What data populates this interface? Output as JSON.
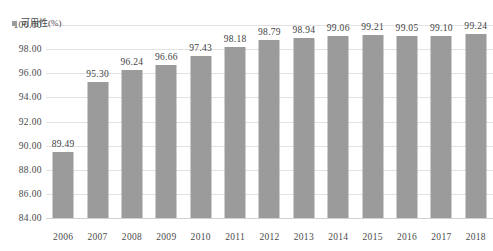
{
  "chart_data": {
    "type": "bar",
    "title": "",
    "subtitle": "",
    "xlabel": "",
    "ylabel": "",
    "categories": [
      "2006",
      "2007",
      "2008",
      "2009",
      "2010",
      "2011",
      "2012",
      "2013",
      "2014",
      "2015",
      "2016",
      "2017",
      "2018"
    ],
    "values": [
      89.49,
      95.3,
      96.24,
      96.66,
      97.43,
      98.18,
      98.79,
      98.94,
      99.06,
      99.21,
      99.05,
      99.1,
      99.24
    ],
    "value_labels": [
      "89.49",
      "95.30",
      "96.24",
      "96.66",
      "97.43",
      "98.18",
      "98.79",
      "98.94",
      "99.06",
      "99.21",
      "99.05",
      "99.10",
      "99.24"
    ],
    "series": [
      {
        "name": "可用性(%)",
        "values": [
          89.49,
          95.3,
          96.24,
          96.66,
          97.43,
          98.18,
          98.79,
          98.94,
          99.06,
          99.21,
          99.05,
          99.1,
          99.24
        ],
        "color": "#9b9b9b"
      }
    ],
    "legend": {
      "position": "top-left",
      "entries": [
        {
          "label": "可用性(%)",
          "color": "#9b9b9b",
          "marker": "square"
        }
      ]
    },
    "ylim": [
      84.0,
      100.0
    ],
    "ytick_step": 2.0,
    "ytick_labels": [
      "100.00",
      "98.00",
      "96.00",
      "94.00",
      "92.00",
      "90.00",
      "88.00",
      "86.00",
      "84.00"
    ],
    "ytick_values": [
      100.0,
      98.0,
      96.0,
      94.0,
      92.0,
      90.0,
      88.0,
      86.0,
      84.0
    ],
    "xtick_labels": [
      "2006",
      "2007",
      "2008",
      "2009",
      "2010",
      "2011",
      "2012",
      "2013",
      "2014",
      "2015",
      "2016",
      "2017",
      "2018"
    ],
    "grid": true,
    "grid_color": "#e2e2e2",
    "background": "#ffffff",
    "data_labels_shown": true
  }
}
